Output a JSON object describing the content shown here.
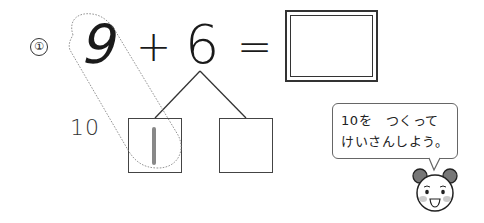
{
  "problem": {
    "number_label": "①",
    "operand1": "9",
    "operator": "+",
    "operand2": "6",
    "equals": "=",
    "answer_value": ""
  },
  "decomposition": {
    "side_label": "10",
    "left_box_value": "1",
    "right_box_value": ""
  },
  "hint": {
    "line1": "10を　つくって",
    "line2": "けいさんしよう。"
  },
  "mascot": {
    "name": "bear-face"
  },
  "colors": {
    "ink": "#222222",
    "dotted_outline": "#888888",
    "box_value": "#888888",
    "bear_ear": "#777777",
    "bear_cheek": "#cccccc"
  }
}
